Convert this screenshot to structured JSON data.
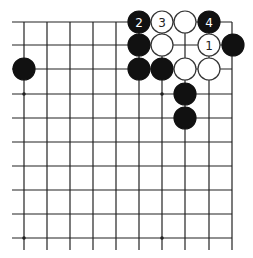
{
  "diagram": {
    "type": "go-board-fragment",
    "grid": {
      "columns": 10,
      "rows": 10,
      "x": [
        24,
        47,
        70,
        93,
        116,
        139,
        162,
        185,
        209,
        232
      ],
      "y": [
        22,
        45,
        69,
        94,
        118,
        142,
        166,
        190,
        214,
        238
      ],
      "left_extend_to": 12,
      "bottom_extend_to": 250,
      "top_edge": true,
      "right_edge": true,
      "line_color": "#222222"
    },
    "star_points": [
      {
        "col": 0,
        "row": 3
      },
      {
        "col": 6,
        "row": 3
      },
      {
        "col": 0,
        "row": 9
      },
      {
        "col": 6,
        "row": 9
      }
    ],
    "stone_radius": 11,
    "colors": {
      "black": "#111111",
      "white_fill": "#ffffff",
      "white_stroke": "#333333",
      "label_on_black": "#ffffff",
      "label_on_white": "#222222"
    },
    "stones": [
      {
        "color": "black",
        "col": 5,
        "row": 0,
        "label": "2"
      },
      {
        "color": "white",
        "col": 6,
        "row": 0,
        "label": "3"
      },
      {
        "color": "white",
        "col": 7,
        "row": 0,
        "label": ""
      },
      {
        "color": "black",
        "col": 8,
        "row": 0,
        "label": "4"
      },
      {
        "color": "black",
        "col": 5,
        "row": 1,
        "label": ""
      },
      {
        "color": "white",
        "col": 6,
        "row": 1,
        "label": ""
      },
      {
        "color": "white",
        "col": 8,
        "row": 1,
        "label": "1"
      },
      {
        "color": "black",
        "col": 9,
        "row": 1,
        "label": ""
      },
      {
        "color": "black",
        "col": 0,
        "row": 2,
        "label": ""
      },
      {
        "color": "black",
        "col": 5,
        "row": 2,
        "label": ""
      },
      {
        "color": "black",
        "col": 6,
        "row": 2,
        "label": ""
      },
      {
        "color": "white",
        "col": 7,
        "row": 2,
        "label": ""
      },
      {
        "color": "white",
        "col": 8,
        "row": 2,
        "label": ""
      },
      {
        "color": "black",
        "col": 7,
        "row": 3,
        "label": ""
      },
      {
        "color": "black",
        "col": 7,
        "row": 4,
        "label": ""
      }
    ]
  }
}
